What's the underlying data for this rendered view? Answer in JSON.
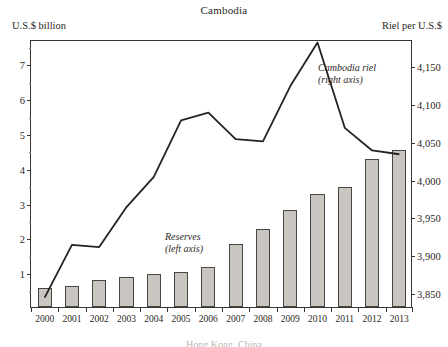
{
  "header": {
    "title": "Cambodia",
    "left_axis_caption": "U.S.$ billion",
    "right_axis_caption": "Riel per U.S.$"
  },
  "annotations": {
    "line_label_1": "Cambodia riel",
    "line_label_2": "(right axis)",
    "bar_label_1": "Reserves",
    "bar_label_2": "(left axis)"
  },
  "footnote": "Hong Kong, China",
  "colors": {
    "bar_fill": "#c9c6c1",
    "bar_stroke": "#4a4540",
    "line": "#262220",
    "frame": "#3a3430",
    "text": "#2b2724"
  },
  "chart_data": {
    "type": "bar",
    "title": "Cambodia",
    "xlabel": "",
    "ylabel": "U.S.$ billion",
    "y2label": "Riel per U.S.$",
    "grid": false,
    "legend_position": "inline-annotations",
    "categories": [
      "2000",
      "2001",
      "2002",
      "2003",
      "2004",
      "2005",
      "2006",
      "2007",
      "2008",
      "2009",
      "2010",
      "2011",
      "2012",
      "2013"
    ],
    "ylim": [
      0,
      7.7
    ],
    "y_ticks": [
      1,
      2,
      3,
      4,
      5,
      6,
      7
    ],
    "y_tick_labels": [
      "1",
      "2",
      "3",
      "4",
      "5",
      "6",
      "7"
    ],
    "y2lim": [
      3830,
      4185
    ],
    "y2_ticks": [
      3850,
      3900,
      3950,
      4000,
      4050,
      4100,
      4150
    ],
    "y2_tick_labels": [
      "3,850",
      "3,900",
      "3,950",
      "4,000",
      "4,050",
      "4,100",
      "4,150"
    ],
    "series": [
      {
        "name": "Reserves",
        "axis": "left",
        "type": "bar",
        "unit": "U.S.$ billion",
        "values": [
          0.55,
          0.6,
          0.78,
          0.87,
          0.95,
          1.0,
          1.15,
          1.8,
          2.25,
          2.8,
          3.25,
          3.45,
          4.25,
          4.5
        ]
      },
      {
        "name": "Cambodia riel",
        "axis": "right",
        "type": "line",
        "unit": "Riel per U.S.$",
        "values": [
          3845,
          3915,
          3912,
          3965,
          4005,
          4080,
          4090,
          4055,
          4052,
          4125,
          4183,
          4070,
          4040,
          4035
        ]
      }
    ]
  }
}
